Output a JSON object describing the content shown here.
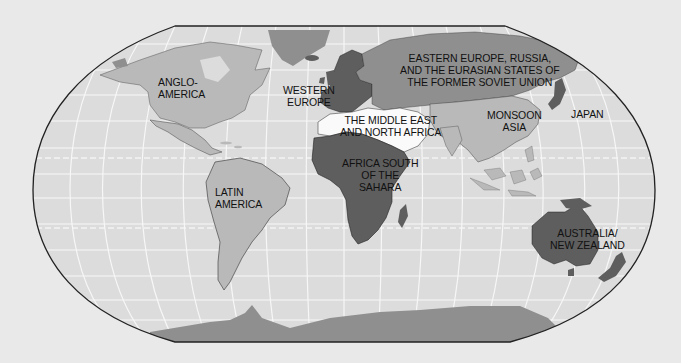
{
  "map": {
    "title": "World Regions",
    "colors": {
      "background": "#e9e9e9",
      "ocean": "#dcdcdc",
      "graticule": "#f6f6f6",
      "frame": "#222222",
      "light_region": "#b9b9b9",
      "medium_region": "#8f8f8f",
      "dark_region": "#5e5e5e",
      "white_region": "#fafafa",
      "border_lines": "#333333"
    },
    "regions": [
      {
        "id": "anglo-america",
        "label": "ANGLO-\nAMERICA",
        "shade": "light"
      },
      {
        "id": "western-europe",
        "label": "WESTERN\nEUROPE",
        "shade": "dark"
      },
      {
        "id": "eastern-europe-russia",
        "label": "EASTERN EUROPE, RUSSIA,\nAND THE EURASIAN STATES OF\nTHE FORMER SOVIET UNION",
        "shade": "medium"
      },
      {
        "id": "middle-east-north-africa",
        "label": "THE MIDDLE EAST\nAND NORTH AFRICA",
        "shade": "white"
      },
      {
        "id": "monsoon-asia",
        "label": "MONSOON\nASIA",
        "shade": "light"
      },
      {
        "id": "japan",
        "label": "JAPAN",
        "shade": "dark"
      },
      {
        "id": "africa-south-of-sahara",
        "label": "AFRICA SOUTH\nOF THE\nSAHARA",
        "shade": "dark"
      },
      {
        "id": "latin-america",
        "label": "LATIN\nAMERICA",
        "shade": "light"
      },
      {
        "id": "australia-new-zealand",
        "label": "AUSTRALIA/\nNEW ZEALAND",
        "shade": "dark"
      }
    ]
  }
}
